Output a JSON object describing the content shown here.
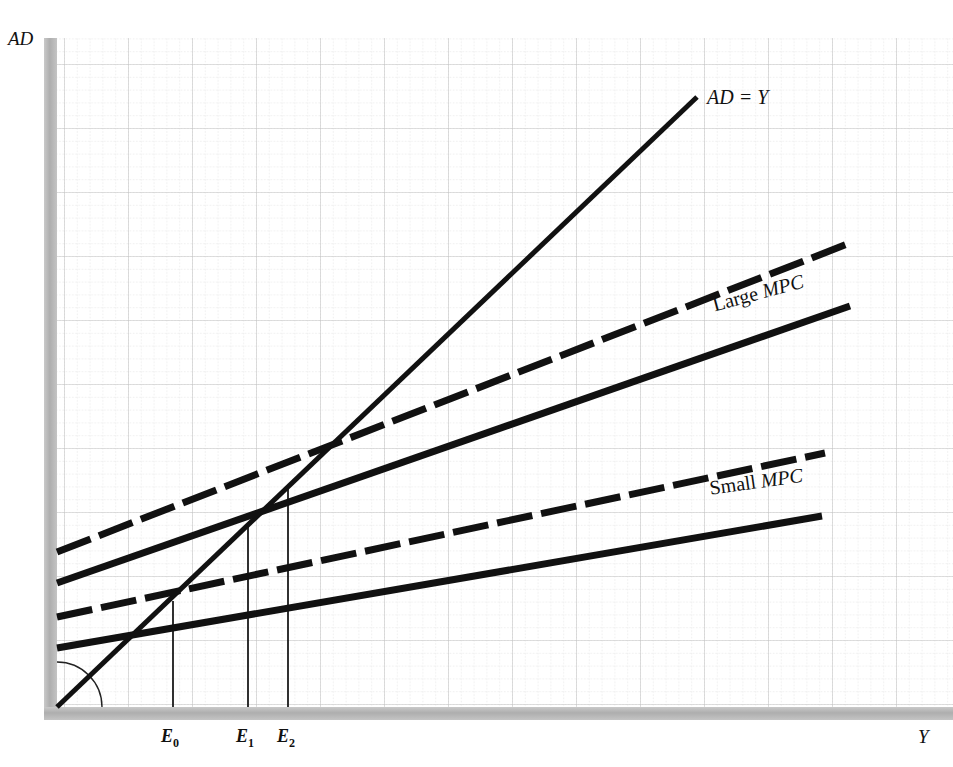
{
  "figure": {
    "background": "#ffffff",
    "ink_color": "#111111",
    "axis_band_color": "#b2b2b2",
    "grid_minor_color": "#d8d8d8",
    "grid_major_color": "#bfbfbf"
  },
  "axes": {
    "y_label": "AD",
    "x_label": "Y",
    "origin": {
      "x": 57,
      "y": 707
    },
    "plot_right": 953,
    "plot_top": 40
  },
  "ticks": [
    {
      "name": "E0",
      "label": "E",
      "subscript": "0",
      "x": 173
    },
    {
      "name": "E1",
      "label": "E",
      "subscript": "1",
      "x": 248
    },
    {
      "name": "E2",
      "label": "E",
      "subscript": "2",
      "x": 288
    }
  ],
  "curve_labels": {
    "ad_line": "AD = Y",
    "large_mpc_plain": "Large ",
    "large_mpc_italic": "MPC",
    "small_mpc_plain": "Small ",
    "small_mpc_italic": "MPC"
  },
  "chart_data": {
    "type": "line",
    "title": "",
    "subtitle": "",
    "xlabel": "Y",
    "ylabel": "AD",
    "xlim": [
      0,
      953
    ],
    "ylim": [
      0,
      707
    ],
    "grid": true,
    "grid_minor_spacing_px": 12.8,
    "grid_major_spacing_px": 64,
    "legend": "inline-labels",
    "annotations": [
      {
        "text": "AD = Y",
        "x": 707,
        "y": 97,
        "style": "italic"
      },
      {
        "text": "Large MPC",
        "x": 710,
        "y": 300,
        "style": "rotated -15deg"
      },
      {
        "text": "Small MPC",
        "x": 708,
        "y": 483,
        "style": "rotated -8deg"
      },
      {
        "text": "45 degree angle arc",
        "x": 57,
        "y": 707,
        "style": "thin-arc"
      }
    ],
    "equilibria": [
      {
        "name": "E0",
        "x": 173,
        "y": 601,
        "note": "common intersection of all four AD schedules with AD = Y"
      },
      {
        "name": "E1",
        "x": 248,
        "y": 527,
        "note": "intersection of shifted small-MPC schedule with AD = Y"
      },
      {
        "name": "E2",
        "x": 288,
        "y": 487,
        "note": "intersection of shifted large-MPC schedule with AD = Y"
      }
    ],
    "series": [
      {
        "name": "AD = Y",
        "style": "solid",
        "linewidth": 5,
        "points": [
          {
            "x": 57,
            "y": 707
          },
          {
            "x": 697,
            "y": 97
          }
        ]
      },
      {
        "name": "Large MPC shifted",
        "style": "dashed",
        "linewidth": 7,
        "points": [
          {
            "x": 57,
            "y": 552
          },
          {
            "x": 850,
            "y": 243
          }
        ]
      },
      {
        "name": "Large MPC original",
        "style": "solid",
        "linewidth": 7,
        "points": [
          {
            "x": 57,
            "y": 583
          },
          {
            "x": 850,
            "y": 306
          }
        ]
      },
      {
        "name": "Small MPC shifted",
        "style": "dashed",
        "linewidth": 7,
        "points": [
          {
            "x": 57,
            "y": 617
          },
          {
            "x": 825,
            "y": 453
          }
        ]
      },
      {
        "name": "Small MPC original",
        "style": "solid",
        "linewidth": 7,
        "points": [
          {
            "x": 57,
            "y": 648
          },
          {
            "x": 822,
            "y": 516
          }
        ]
      }
    ],
    "droplines": [
      {
        "name": "E0",
        "x": 173,
        "y_top": 601,
        "y_bottom": 707
      },
      {
        "name": "E1",
        "x": 248,
        "y_top": 527,
        "y_bottom": 707
      },
      {
        "name": "E2",
        "x": 288,
        "y_top": 487,
        "y_bottom": 707
      }
    ]
  }
}
